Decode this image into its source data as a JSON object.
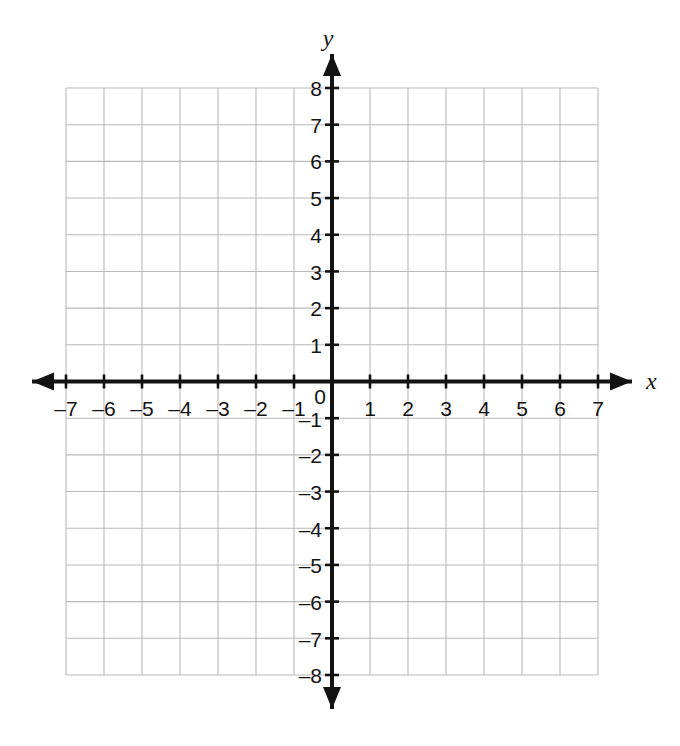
{
  "figure": {
    "kind": "coordinate-plane",
    "axis_labels": {
      "x": "x",
      "y": "y"
    },
    "origin_label": "0"
  },
  "chart_data": {
    "type": "scatter",
    "title": "",
    "subtitle": "",
    "xlabel": "x",
    "ylabel": "y",
    "xlim": [
      -7,
      7
    ],
    "ylim": [
      -8,
      8
    ],
    "xticks": [
      -7,
      -6,
      -5,
      -4,
      -3,
      -2,
      -1,
      0,
      1,
      2,
      3,
      4,
      5,
      6,
      7
    ],
    "yticks": [
      -8,
      -7,
      -6,
      -5,
      -4,
      -3,
      -2,
      -1,
      0,
      1,
      2,
      3,
      4,
      5,
      6,
      7,
      8
    ],
    "xtick_labels": [
      "–7",
      "–6",
      "–5",
      "–4",
      "–3",
      "–2",
      "–1",
      "0",
      "1",
      "2",
      "3",
      "4",
      "5",
      "6",
      "7"
    ],
    "ytick_labels": [
      "–8",
      "–7",
      "–6",
      "–5",
      "–4",
      "–3",
      "–2",
      "–1",
      "0",
      "1",
      "2",
      "3",
      "4",
      "5",
      "6",
      "7",
      "8"
    ],
    "grid": true,
    "grid_step": 1,
    "legend": null,
    "series": [],
    "annotations": [],
    "colors": {
      "grid": "#b9b9b9",
      "axis": "#131313",
      "text": "#131313",
      "background": "#ffffff"
    }
  },
  "x_axis_labels": [
    {
      "text": "–7",
      "x": 66,
      "y": 398
    },
    {
      "text": "–6",
      "x": 104,
      "y": 398
    },
    {
      "text": "–5",
      "x": 142,
      "y": 398
    },
    {
      "text": "–4",
      "x": 180,
      "y": 398
    },
    {
      "text": "–3",
      "x": 218,
      "y": 398
    },
    {
      "text": "–2",
      "x": 256,
      "y": 398
    },
    {
      "text": "–1",
      "x": 294,
      "y": 398
    },
    {
      "text": "1",
      "x": 370,
      "y": 398
    },
    {
      "text": "2",
      "x": 408,
      "y": 398
    },
    {
      "text": "3",
      "x": 446,
      "y": 398
    },
    {
      "text": "4",
      "x": 484,
      "y": 398
    },
    {
      "text": "5",
      "x": 522,
      "y": 398
    },
    {
      "text": "6",
      "x": 560,
      "y": 398
    },
    {
      "text": "7",
      "x": 598,
      "y": 398
    }
  ],
  "y_axis_labels": [
    {
      "text": "8",
      "y": 88
    },
    {
      "text": "7",
      "y": 125
    },
    {
      "text": "6",
      "y": 161
    },
    {
      "text": "5",
      "y": 198
    },
    {
      "text": "4",
      "y": 235
    },
    {
      "text": "3",
      "y": 272
    },
    {
      "text": "2",
      "y": 308
    },
    {
      "text": "1",
      "y": 345
    },
    {
      "text": "–1",
      "y": 419
    },
    {
      "text": "–2",
      "y": 455
    },
    {
      "text": "–3",
      "y": 492
    },
    {
      "text": "–4",
      "y": 529
    },
    {
      "text": "–5",
      "y": 565
    },
    {
      "text": "–6",
      "y": 602
    },
    {
      "text": "–7",
      "y": 639
    },
    {
      "text": "–8",
      "y": 675
    }
  ]
}
